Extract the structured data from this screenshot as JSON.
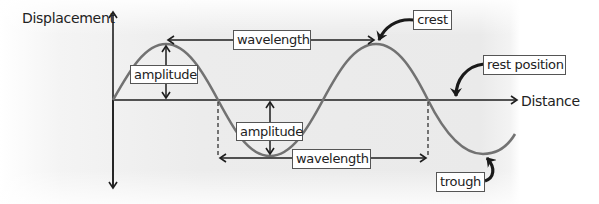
{
  "diagram": {
    "type": "transverse-wave",
    "axes": {
      "y_label": "Displacement",
      "x_label": "Distance"
    },
    "labels": {
      "wavelength_top": "wavelength",
      "wavelength_bottom": "wavelength",
      "amplitude_top": "amplitude",
      "amplitude_bottom": "amplitude",
      "crest": "crest",
      "rest_position": "rest position",
      "trough": "trough"
    },
    "colors": {
      "wave": "#727272",
      "axis": "#1e1e1e",
      "callout_arrow": "#1a1a1a",
      "label_border": "#555555",
      "background_panel": "#ebebeb"
    }
  }
}
